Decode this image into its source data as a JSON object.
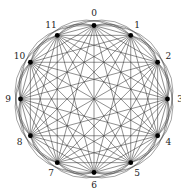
{
  "diagram": {
    "type": "complete-graph",
    "name": "K12",
    "node_count": 12,
    "nodes": [
      {
        "id": 0,
        "label": "0"
      },
      {
        "id": 1,
        "label": "1"
      },
      {
        "id": 2,
        "label": "2"
      },
      {
        "id": 3,
        "label": "3"
      },
      {
        "id": 4,
        "label": "4"
      },
      {
        "id": 5,
        "label": "5"
      },
      {
        "id": 6,
        "label": "6"
      },
      {
        "id": 7,
        "label": "7"
      },
      {
        "id": 8,
        "label": "8"
      },
      {
        "id": 9,
        "label": "9"
      },
      {
        "id": 10,
        "label": "10"
      },
      {
        "id": 11,
        "label": "11"
      }
    ],
    "edges": "all-pairs",
    "colors": {
      "edge": "#333333",
      "node": "#000000",
      "label": "#222222",
      "background": "#ffffff"
    }
  }
}
